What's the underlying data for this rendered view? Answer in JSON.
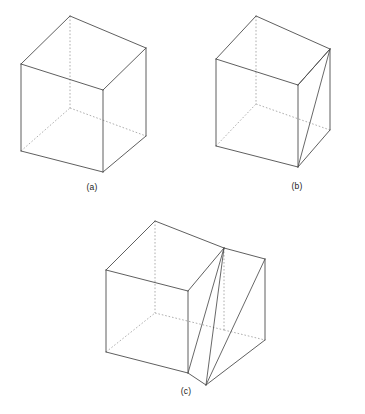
{
  "figure": {
    "background_color": "#ffffff",
    "solid_edge_color": "#4d4d4d",
    "hidden_edge_color": "#9a9a9a",
    "label_color": "#1a1a1a",
    "width": 365,
    "height": 414
  },
  "panels": [
    {
      "id": "a",
      "label": "(a)",
      "label_x": 92,
      "label_y": 187,
      "description": "Plain wireframe cube in isometric view with hidden rear edges dashed",
      "vertices": {
        "front_top": "103,90",
        "front_bottom": "103,172",
        "left_top": "21,64",
        "left_bottom": "21,151",
        "right_top": "146,48",
        "right_bottom": "146,136",
        "back_top": "70,16",
        "back_bottom": "70,108"
      },
      "solid_edges": [
        "21,64 103,90",
        "103,90 146,48",
        "146,48 70,16",
        "70,16 21,64",
        "21,64 21,151",
        "103,90 103,172",
        "146,48 146,136",
        "21,151 103,172",
        "103,172 146,136"
      ],
      "hidden_edges": [
        "70,16 70,108",
        "21,151 70,108",
        "70,108 146,136"
      ]
    },
    {
      "id": "b",
      "label": "(b)",
      "label_x": 297,
      "label_y": 186,
      "description": "Cube with a triangular diagonal cut plane from the top-right vertical edge to the front-bottom vertex",
      "vertices": {
        "front_top": "298,85",
        "front_bottom": "298,167",
        "left_top": "216,59",
        "left_bottom": "216,146",
        "right_top": "330,49",
        "right_bottom": "330,130",
        "back_top": "256,16",
        "back_bottom": "256,104"
      },
      "solid_edges": [
        "216,59 298,85",
        "298,85 330,49",
        "330,49 256,16",
        "256,16 216,59",
        "216,59 216,146",
        "298,85 298,167",
        "330,49 330,130",
        "216,146 298,167",
        "298,167 330,130"
      ],
      "hidden_edges": [
        "256,16 256,104",
        "216,146 256,104",
        "256,104 330,130"
      ],
      "cut_edges": [
        "330,49 298,167",
        "298,85 330,49"
      ]
    },
    {
      "id": "c",
      "label": "(c)",
      "label_x": 186,
      "label_y": 391,
      "description": "Wider cuboid with an inclined slab: a slanted quadrilateral plane spanning from the upper rear edge down to the front-bottom, plus an extruded wedge at the right",
      "vertices": {
        "front_top": "188,291",
        "front_bottom": "188,373",
        "left_top": "106,270",
        "left_bottom": "106,352",
        "back_top": "155,221",
        "right_back_top": "224,248",
        "right_top": "265,259",
        "right_bottom": "265,340",
        "slab_top": "224,248",
        "slab_mid": "224,330",
        "slab_front_bottom": "206,385"
      },
      "solid_edges": [
        "106,270 188,291",
        "188,291 224,248",
        "224,248 155,221",
        "155,221 106,270",
        "106,270 106,352",
        "188,291 188,373",
        "224,248 265,259",
        "265,259 265,340",
        "106,352 188,373",
        "188,373 206,385",
        "206,385 265,340"
      ],
      "hidden_edges": [
        "155,221 155,313",
        "106,352 155,313",
        "155,313 224,330",
        "224,248 224,330",
        "224,330 265,340"
      ],
      "cut_edges": [
        "224,248 188,373",
        "224,248 206,385",
        "265,259 206,385"
      ]
    }
  ]
}
